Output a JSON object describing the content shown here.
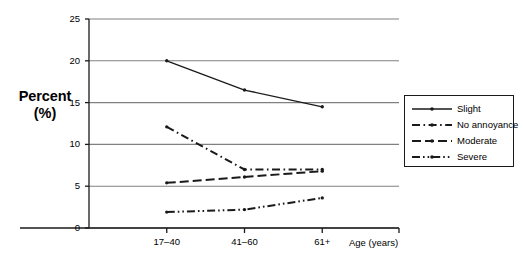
{
  "chart_data": {
    "type": "line",
    "title": "",
    "xlabel": "Age (years)",
    "ylabel": "Percent (%)",
    "ylabel_line1": "Percent",
    "ylabel_line2": "(%)",
    "categories": [
      "17–40",
      "41–60",
      "61+"
    ],
    "ylim": [
      0,
      25
    ],
    "yticks": [
      0,
      5,
      10,
      15,
      20,
      25
    ],
    "ytick_labels": [
      "0",
      "5",
      "10",
      "15",
      "20",
      "25"
    ],
    "grid": "horizontal",
    "legend_position": "right",
    "series": [
      {
        "name": "Slight",
        "values": [
          20.0,
          16.5,
          14.5
        ],
        "style": "solid",
        "marker": "dot",
        "color": "#1a1a1a"
      },
      {
        "name": "No annoyance",
        "values": [
          12.1,
          7.0,
          7.0
        ],
        "style": "dash-dot",
        "marker": "dot",
        "color": "#1a1a1a"
      },
      {
        "name": "Moderate",
        "values": [
          5.4,
          6.1,
          6.8
        ],
        "style": "dashed",
        "marker": "dot",
        "color": "#1a1a1a"
      },
      {
        "name": "Severe",
        "values": [
          1.9,
          2.2,
          3.6
        ],
        "style": "dash-dot-dot",
        "marker": "dot",
        "color": "#1a1a1a"
      }
    ],
    "colors": {
      "axis": "#1a1a1a",
      "grid": "#808080",
      "background": "#ffffff"
    }
  }
}
